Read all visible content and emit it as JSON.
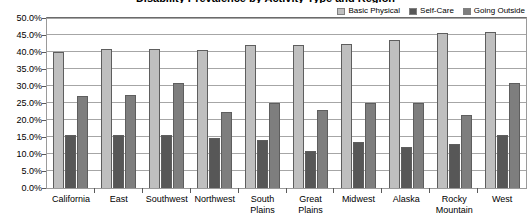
{
  "chart_data": {
    "type": "bar",
    "title": "Disability Prevalence by Activity Type and Region",
    "xlabel": "",
    "ylabel": "",
    "ylim": [
      0,
      50
    ],
    "ytick_values": [
      0,
      5,
      10,
      15,
      20,
      25,
      30,
      35,
      40,
      45,
      50
    ],
    "ytick_labels": [
      "0.0%",
      "5.0%",
      "10.0%",
      "15.0%",
      "20.0%",
      "25.0%",
      "30.0%",
      "35.0%",
      "40.0%",
      "45.0%",
      "50.0%"
    ],
    "grid": true,
    "legend_position": "top-right",
    "categories": [
      "California",
      "East",
      "Southwest",
      "Northwest",
      "South Plains",
      "Great Plains",
      "Midwest",
      "Alaska",
      "Rocky Mountain",
      "West"
    ],
    "series": [
      {
        "name": "Basic Physical",
        "color": "#bfbfbf",
        "values": [
          40.0,
          41.0,
          41.0,
          40.5,
          42.0,
          42.0,
          42.5,
          43.5,
          45.5,
          46.0
        ]
      },
      {
        "name": "Self-Care",
        "color": "#575757",
        "values": [
          15.5,
          15.5,
          15.5,
          14.8,
          14.0,
          11.0,
          13.5,
          12.0,
          13.0,
          15.5
        ]
      },
      {
        "name": "Going Outside",
        "color": "#7e7e7e",
        "values": [
          27.0,
          27.3,
          31.0,
          22.5,
          25.0,
          23.0,
          25.0,
          25.0,
          21.5,
          31.0
        ]
      }
    ]
  }
}
